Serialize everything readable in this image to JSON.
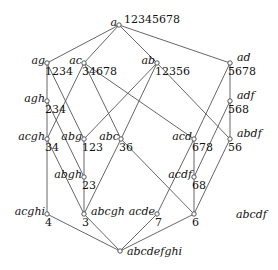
{
  "diagram": {
    "type": "concept-lattice",
    "nodes": [
      {
        "id": "a",
        "name": "a",
        "extent": "12345678",
        "x": 119,
        "y": 25
      },
      {
        "id": "ag",
        "name": "ag",
        "extent": "1234",
        "x": 47,
        "y": 63
      },
      {
        "id": "ac",
        "name": "ac",
        "extent": "34678",
        "x": 84,
        "y": 63
      },
      {
        "id": "ab",
        "name": "ab",
        "extent": "12356",
        "x": 157,
        "y": 63
      },
      {
        "id": "ad",
        "name": "ad",
        "extent": "5678",
        "x": 230,
        "y": 63
      },
      {
        "id": "agh",
        "name": "agh",
        "extent": "234",
        "x": 47,
        "y": 101
      },
      {
        "id": "adf",
        "name": "adf",
        "extent": "568",
        "x": 230,
        "y": 101
      },
      {
        "id": "acgh",
        "name": "acgh",
        "extent": "34",
        "x": 47,
        "y": 139
      },
      {
        "id": "abg",
        "name": "abg",
        "extent": "123",
        "x": 84,
        "y": 139
      },
      {
        "id": "abc",
        "name": "abc",
        "extent": "36",
        "x": 121,
        "y": 139
      },
      {
        "id": "acd",
        "name": "acd",
        "extent": "678",
        "x": 194,
        "y": 139
      },
      {
        "id": "abdf",
        "name": "abdf",
        "extent": "56",
        "x": 230,
        "y": 139
      },
      {
        "id": "abgh",
        "name": "abgh",
        "extent": "23",
        "x": 84,
        "y": 177
      },
      {
        "id": "acdf",
        "name": "acdf",
        "extent": "68",
        "x": 194,
        "y": 177
      },
      {
        "id": "acghi",
        "name": "acghi",
        "extent": "4",
        "x": 47,
        "y": 214
      },
      {
        "id": "abcgh",
        "name": "abcgh",
        "extent": "3",
        "x": 84,
        "y": 214
      },
      {
        "id": "acde",
        "name": "acde",
        "extent": "7",
        "x": 157,
        "y": 214
      },
      {
        "id": "n6",
        "name": "",
        "extent": "6",
        "x": 194,
        "y": 214
      },
      {
        "id": "bottom",
        "name": "abcdefghi",
        "extent": "",
        "x": 120,
        "y": 251
      }
    ],
    "edges": [
      [
        "a",
        "ag"
      ],
      [
        "a",
        "ac"
      ],
      [
        "a",
        "ab"
      ],
      [
        "a",
        "ad"
      ],
      [
        "ag",
        "agh"
      ],
      [
        "ag",
        "abg"
      ],
      [
        "ac",
        "acgh"
      ],
      [
        "ac",
        "abc"
      ],
      [
        "ac",
        "acd"
      ],
      [
        "ab",
        "abg"
      ],
      [
        "ab",
        "abc"
      ],
      [
        "ab",
        "abdf"
      ],
      [
        "ad",
        "adf"
      ],
      [
        "ad",
        "acd"
      ],
      [
        "agh",
        "acgh"
      ],
      [
        "agh",
        "abgh"
      ],
      [
        "adf",
        "abdf"
      ],
      [
        "adf",
        "acdf"
      ],
      [
        "acgh",
        "acghi"
      ],
      [
        "acgh",
        "abcgh"
      ],
      [
        "abg",
        "abgh"
      ],
      [
        "abc",
        "abcgh"
      ],
      [
        "abc",
        "n6"
      ],
      [
        "acd",
        "acdf"
      ],
      [
        "acd",
        "acde"
      ],
      [
        "abdf",
        "n6"
      ],
      [
        "abgh",
        "abcgh"
      ],
      [
        "acdf",
        "n6"
      ],
      [
        "acghi",
        "bottom"
      ],
      [
        "abcgh",
        "bottom"
      ],
      [
        "acde",
        "bottom"
      ],
      [
        "n6",
        "bottom"
      ]
    ],
    "floating_labels": [
      {
        "id": "abcdf",
        "text": "abcdf",
        "x": 236,
        "y": 218
      }
    ]
  }
}
